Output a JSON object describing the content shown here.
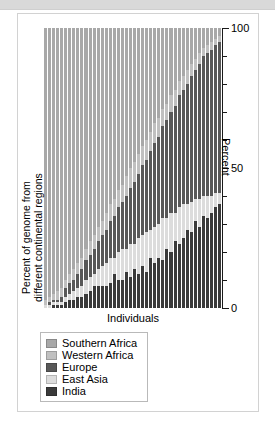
{
  "figure": {
    "top_band": "",
    "xlabel": "Individuals",
    "ylabel_line1": "Percent of genome from",
    "ylabel_line2": "different continental regions",
    "right_axis_title": "Percent"
  },
  "legend": {
    "items": [
      {
        "label": "Southern Africa",
        "color": "#a8a8a8"
      },
      {
        "label": "Western Africa",
        "color": "#c0c0c0"
      },
      {
        "label": "Europe",
        "color": "#585858"
      },
      {
        "label": "East Asia",
        "color": "#dcdcdc"
      },
      {
        "label": "India",
        "color": "#3a3a3a"
      }
    ]
  },
  "axis": {
    "ticks": [
      {
        "value": 100,
        "label": "100",
        "major": true
      },
      {
        "value": 90,
        "label": "",
        "major": false
      },
      {
        "value": 80,
        "label": "",
        "major": false
      },
      {
        "value": 70,
        "label": "",
        "major": false
      },
      {
        "value": 60,
        "label": "",
        "major": false
      },
      {
        "value": 50,
        "label": "50",
        "major": true
      },
      {
        "value": 40,
        "label": "",
        "major": false
      },
      {
        "value": 30,
        "label": "",
        "major": false
      },
      {
        "value": 20,
        "label": "",
        "major": false
      },
      {
        "value": 10,
        "label": "",
        "major": false
      },
      {
        "value": 0,
        "label": "0",
        "major": true
      }
    ]
  },
  "chart_data": {
    "type": "bar",
    "stacked": true,
    "title": "",
    "subtitle": "",
    "xlabel": "Individuals",
    "ylabel": "Percent of genome from different continental regions",
    "ylim": [
      0,
      100
    ],
    "ylabel_right": "Percent",
    "grid": false,
    "legend_position": "below-plot",
    "colors": {
      "Southern Africa": "#a8a8a8",
      "Western Africa": "#c0c0c0",
      "Europe": "#585858",
      "East Asia": "#dcdcdc",
      "India": "#3a3a3a"
    },
    "stack_order_bottom_to_top": [
      "India",
      "East Asia",
      "Europe",
      "Western Africa",
      "Southern Africa"
    ],
    "categories": [
      "1",
      "2",
      "3",
      "4",
      "5",
      "6",
      "7",
      "8",
      "9",
      "10",
      "11",
      "12",
      "13",
      "14",
      "15",
      "16",
      "17",
      "18",
      "19",
      "20",
      "21",
      "22",
      "23",
      "24",
      "25",
      "26",
      "27",
      "28",
      "29",
      "30",
      "31",
      "32",
      "33",
      "34",
      "35",
      "36",
      "37",
      "38",
      "39",
      "40",
      "41",
      "42",
      "43",
      "44"
    ],
    "series": [
      {
        "name": "Southern Africa",
        "values": [
          97,
          96,
          95,
          94,
          93,
          90,
          88,
          86,
          84,
          82,
          79,
          76,
          74,
          71,
          69,
          66,
          63,
          61,
          58,
          56,
          53,
          50,
          48,
          45,
          42,
          40,
          37,
          34,
          32,
          29,
          27,
          24,
          22,
          19,
          17,
          15,
          13,
          11,
          9,
          7,
          6,
          5,
          4,
          3
        ]
      },
      {
        "name": "Western Africa",
        "values": [
          2,
          2,
          2,
          3,
          3,
          3,
          3,
          4,
          4,
          4,
          4,
          5,
          5,
          5,
          5,
          6,
          6,
          6,
          6,
          6,
          7,
          7,
          7,
          7,
          7,
          7,
          7,
          7,
          7,
          6,
          6,
          6,
          6,
          5,
          5,
          5,
          4,
          4,
          4,
          3,
          3,
          3,
          2,
          2
        ]
      },
      {
        "name": "Europe",
        "values": [
          0,
          1,
          1,
          1,
          2,
          3,
          4,
          4,
          5,
          6,
          7,
          8,
          9,
          10,
          11,
          12,
          13,
          15,
          16,
          17,
          19,
          20,
          22,
          23,
          25,
          26,
          28,
          30,
          31,
          33,
          35,
          36,
          38,
          40,
          41,
          43,
          45,
          46,
          48,
          50,
          51,
          52,
          53,
          54
        ]
      },
      {
        "name": "East Asia",
        "values": [
          1,
          1,
          1,
          1,
          1,
          2,
          2,
          3,
          3,
          4,
          5,
          5,
          4,
          6,
          7,
          8,
          9,
          6,
          10,
          11,
          8,
          12,
          9,
          13,
          11,
          14,
          10,
          13,
          12,
          15,
          11,
          14,
          10,
          13,
          12,
          9,
          11,
          8,
          10,
          7,
          8,
          6,
          5,
          4
        ]
      },
      {
        "name": "India",
        "values": [
          0,
          0,
          1,
          1,
          1,
          2,
          3,
          3,
          4,
          4,
          5,
          6,
          8,
          8,
          8,
          8,
          9,
          12,
          10,
          10,
          13,
          11,
          14,
          12,
          15,
          13,
          18,
          16,
          18,
          17,
          21,
          20,
          24,
          23,
          25,
          28,
          27,
          31,
          29,
          33,
          32,
          34,
          36,
          37
        ]
      }
    ]
  }
}
